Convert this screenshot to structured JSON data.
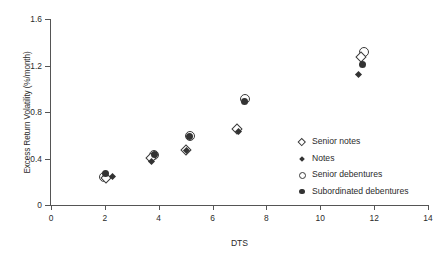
{
  "chart_data": {
    "type": "scatter",
    "title": "",
    "xlabel": "DTS",
    "ylabel": "Excess Return Volatility (%/month)",
    "xlim": [
      0,
      14
    ],
    "ylim": [
      0,
      1.6
    ],
    "xticks": [
      "0",
      "2",
      "4",
      "6",
      "8",
      "10",
      "12",
      "14"
    ],
    "xtick_values": [
      0,
      2,
      4,
      6,
      8,
      10,
      12,
      14
    ],
    "yticks": [
      "0",
      "0.4",
      "0.8",
      "1.2",
      "1.6"
    ],
    "ytick_values": [
      0,
      0.4,
      0.8,
      1.2,
      1.6
    ],
    "grid": false,
    "legend_position": "inside-right",
    "series": [
      {
        "name": "Senior notes",
        "marker": "diamond-open",
        "points": [
          {
            "x": 2.05,
            "y": 0.235
          },
          {
            "x": 3.72,
            "y": 0.405
          },
          {
            "x": 5.0,
            "y": 0.47
          },
          {
            "x": 6.9,
            "y": 0.655
          },
          {
            "x": 11.5,
            "y": 1.27
          }
        ]
      },
      {
        "name": "Notes",
        "marker": "diamond-filled",
        "points": [
          {
            "x": 2.3,
            "y": 0.245
          },
          {
            "x": 3.74,
            "y": 0.378
          },
          {
            "x": 5.02,
            "y": 0.468
          },
          {
            "x": 6.95,
            "y": 0.63
          },
          {
            "x": 11.42,
            "y": 1.12
          }
        ]
      },
      {
        "name": "Senior debentures",
        "marker": "circle-open",
        "points": [
          {
            "x": 1.98,
            "y": 0.245
          },
          {
            "x": 3.84,
            "y": 0.432
          },
          {
            "x": 5.15,
            "y": 0.59
          },
          {
            "x": 7.22,
            "y": 0.908
          },
          {
            "x": 11.62,
            "y": 1.32
          }
        ]
      },
      {
        "name": "Subordinated debentures",
        "marker": "circle-filled",
        "points": [
          {
            "x": 2.02,
            "y": 0.268
          },
          {
            "x": 3.86,
            "y": 0.438
          },
          {
            "x": 5.16,
            "y": 0.585
          },
          {
            "x": 7.2,
            "y": 0.888
          },
          {
            "x": 11.55,
            "y": 1.212
          }
        ]
      }
    ],
    "legend": [
      {
        "label": "Senior notes",
        "marker": "diamond-open"
      },
      {
        "label": "Notes",
        "marker": "diamond-filled"
      },
      {
        "label": "Senior debentures",
        "marker": "circle-open"
      },
      {
        "label": "Subordinated debentures",
        "marker": "circle-filled"
      }
    ],
    "colors": {
      "marker_stroke": "#3a3a3a",
      "marker_fill": "#333333",
      "axis": "#555555",
      "text": "#2b2b2b",
      "background": "#ffffff"
    }
  }
}
